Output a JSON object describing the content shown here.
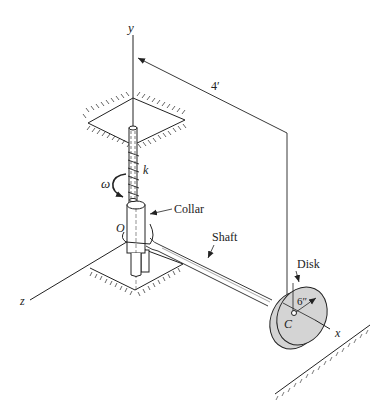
{
  "figure": {
    "type": "mechanical-schematic"
  },
  "axes": {
    "y": "y",
    "z": "z",
    "x": "x"
  },
  "labels": {
    "origin": "O",
    "disk_center": "C",
    "angular_velocity": "ω",
    "spring_constant": "k",
    "collar": "Collar",
    "shaft": "Shaft",
    "disk": "Disk"
  },
  "dimensions": {
    "shaft_length": "4′",
    "disk_radius": "6″"
  },
  "colors": {
    "line": "#222222",
    "disk_fill": "#d4d4d4",
    "background": "#ffffff"
  }
}
